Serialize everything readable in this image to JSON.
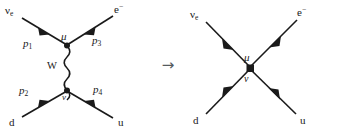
{
  "figure": {
    "transition_arrow": "→",
    "colors": {
      "line": "#1a1a1a",
      "text": "#1a1a1a",
      "arrow": "#555b5e",
      "background": "#ffffff"
    }
  },
  "left_diagram": {
    "name": "w-exchange-diagram",
    "incoming_top": {
      "particle": "ν",
      "subscript": "e",
      "momentum": "p",
      "momentum_index": "1"
    },
    "outgoing_top": {
      "particle": "e",
      "superscript": "−",
      "momentum": "p",
      "momentum_index": "3"
    },
    "incoming_bottom": {
      "particle": "d",
      "momentum": "p",
      "momentum_index": "2"
    },
    "outgoing_bottom": {
      "particle": "u",
      "momentum": "p",
      "momentum_index": "4"
    },
    "propagator": {
      "label": "W",
      "style": "wavy"
    },
    "vertex_upper": "μ",
    "vertex_lower": "ν"
  },
  "right_diagram": {
    "name": "contact-interaction-diagram",
    "incoming_top": {
      "particle": "ν",
      "subscript": "e"
    },
    "outgoing_top": {
      "particle": "e",
      "superscript": "−"
    },
    "incoming_bottom": {
      "particle": "d"
    },
    "outgoing_bottom": {
      "particle": "u"
    },
    "vertex_upper": "μ",
    "vertex_lower": "ν"
  }
}
